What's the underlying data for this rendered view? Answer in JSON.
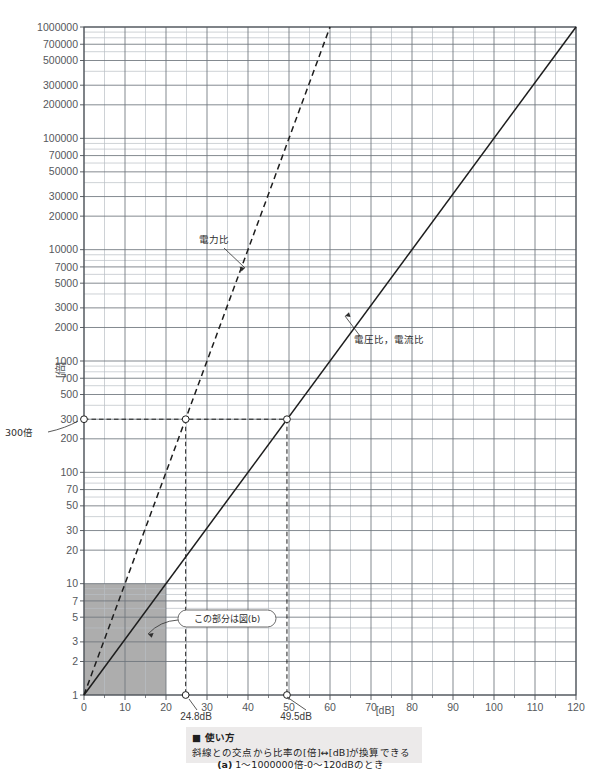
{
  "chart_data": {
    "type": "line",
    "title": "",
    "xlabel": "[dB]",
    "ylabel": "[倍]",
    "xlim": [
      0,
      120
    ],
    "ylim": [
      1,
      1000000
    ],
    "yscale": "log",
    "grid": true,
    "legend_position": "inline-annotations",
    "x_ticks": [
      0,
      10,
      20,
      30,
      40,
      50,
      60,
      70,
      80,
      90,
      100,
      110,
      120
    ],
    "x_tick_labels": [
      "0",
      "10",
      "20",
      "30",
      "40",
      "50",
      "60",
      "70",
      "80",
      "90",
      "100",
      "110",
      "120"
    ],
    "x_minor_step": 5,
    "y_ticks": [
      1,
      2,
      3,
      5,
      7,
      10,
      20,
      30,
      50,
      70,
      100,
      200,
      300,
      500,
      700,
      1000,
      2000,
      3000,
      5000,
      7000,
      10000,
      20000,
      30000,
      50000,
      70000,
      100000,
      200000,
      300000,
      500000,
      700000,
      1000000
    ],
    "y_tick_labels": [
      "1",
      "2",
      "3",
      "5",
      "7",
      "10",
      "20",
      "30",
      "50",
      "70",
      "100",
      "200",
      "300",
      "500",
      "700",
      "1000",
      "2000",
      "3000",
      "5000",
      "7000",
      "10000",
      "20000",
      "30000",
      "50000",
      "70000",
      "100000",
      "200000",
      "300000",
      "500000",
      "700000",
      "1000000"
    ],
    "series": [
      {
        "name": "電力比",
        "style": "dashed",
        "formula": "ratio = 10^(dB/10)",
        "points": [
          [
            0,
            1
          ],
          [
            60,
            1000000
          ]
        ]
      },
      {
        "name": "電圧比，電流比",
        "style": "solid",
        "formula": "ratio = 10^(dB/20)",
        "points": [
          [
            0,
            1
          ],
          [
            120,
            1000000
          ]
        ]
      }
    ],
    "markers": [
      {
        "label": "300倍",
        "x": 0,
        "y": 300
      },
      {
        "label": "24.8dB",
        "x": 24.8,
        "y": 300
      },
      {
        "label": "49.5dB",
        "x": 49.5,
        "y": 300
      }
    ],
    "reference_lines": {
      "horizontal_value": 300,
      "vertical_values": [
        24.8,
        49.5
      ]
    },
    "shaded_region": {
      "label": "この部分は図(b)",
      "x_range": [
        0,
        20
      ],
      "y_range": [
        1,
        10
      ],
      "color": "#9f9f9f"
    }
  },
  "annotations": {
    "power_ratio_label": "電力比",
    "voltage_current_ratio_label": "電圧比，電流比",
    "callout_label": "この部分は図(b)",
    "marker_300": "300倍",
    "marker_24_8db": "24.8dB",
    "marker_49_5db": "49.5dB",
    "x_axis_unit": "[dB]",
    "y_axis_unit": "[倍]"
  },
  "usage": {
    "heading": "■ 使い方",
    "body": "斜線との交点から比率の[倍]↔[dB]が換算できる"
  },
  "caption": {
    "index": "(a)",
    "text": "1～1000000倍-0～120dBのとき"
  },
  "colors": {
    "major_grid": "#6e757c",
    "minor_grid": "#b9bec4",
    "axis": "#4a4f55",
    "curve": "#1d1d1d",
    "shade": "#9f9f9f",
    "usage_bg": "#eceaea",
    "text": "#2b2b2b"
  }
}
